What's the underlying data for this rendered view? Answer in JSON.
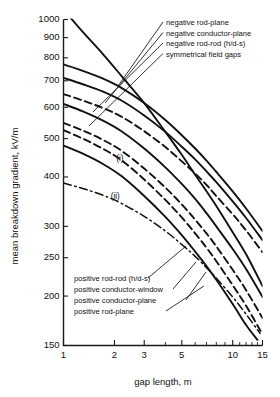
{
  "chart_data": {
    "type": "line",
    "title": "",
    "xlabel": "gap length, m",
    "ylabel": "mean breakdown gradient, kV/m",
    "xscale": "log",
    "yscale": "log",
    "xlim": [
      1,
      15
    ],
    "ylim": [
      150,
      1000
    ],
    "grid": false,
    "legend_position": "inline-annotations",
    "xticks": [
      1,
      2,
      3,
      5,
      10,
      15
    ],
    "xticklabels": [
      "1",
      "2",
      "3",
      "5",
      "10",
      "15"
    ],
    "xminor": [
      4,
      6,
      7,
      8,
      9,
      11,
      12,
      13,
      14
    ],
    "yticks": [
      150,
      200,
      250,
      300,
      400,
      500,
      600,
      700,
      800,
      900,
      1000
    ],
    "yticklabels": [
      "150",
      "200",
      "250",
      "300",
      "400",
      "500",
      "600",
      "700",
      "800",
      "900",
      "1000"
    ],
    "annotations": [
      {
        "name": "curve-note-i",
        "text": "(i)",
        "x": 2.05,
        "y": 440
      },
      {
        "name": "curve-note-ii",
        "text": "(ii)",
        "x": 1.9,
        "y": 352
      }
    ],
    "series": [
      {
        "name": "symmetrical field gaps",
        "style": "solid",
        "x": [
          1,
          1.3,
          1.7,
          2.2,
          3,
          4,
          5,
          6,
          7,
          8,
          10,
          12,
          15
        ],
        "y": [
          1060,
          930,
          820,
          720,
          615,
          520,
          455,
          405,
          368,
          338,
          290,
          255,
          212
        ]
      },
      {
        "name": "negative rod-plane",
        "style": "solid",
        "x": [
          1,
          1.3,
          1.7,
          2.2,
          3,
          4,
          5,
          6,
          7,
          8,
          10,
          12,
          15
        ],
        "y": [
          770,
          742,
          710,
          672,
          615,
          557,
          510,
          472,
          440,
          412,
          368,
          333,
          292
        ]
      },
      {
        "name": "negative conductor-plane",
        "style": "solid",
        "x": [
          1,
          1.3,
          1.7,
          2.2,
          3,
          4,
          5,
          6,
          7,
          8,
          10,
          12,
          15
        ],
        "y": [
          712,
          686,
          658,
          624,
          572,
          520,
          477,
          443,
          413,
          388,
          347,
          315,
          277
        ]
      },
      {
        "name": "negative rod-rod (h/d-s)",
        "style": "dashed",
        "x": [
          1,
          1.3,
          1.7,
          2.2,
          3,
          4,
          5,
          6,
          7,
          8,
          10,
          12,
          15
        ],
        "y": [
          648,
          624,
          598,
          568,
          522,
          476,
          438,
          408,
          382,
          358,
          322,
          293,
          258
        ]
      },
      {
        "name": "positive rod-rod (h/d-s)",
        "style": "solid",
        "x": [
          1,
          1.3,
          1.7,
          2.2,
          3,
          4,
          5,
          6,
          7,
          8,
          10,
          12,
          15
        ],
        "y": [
          612,
          586,
          556,
          522,
          472,
          423,
          384,
          352,
          324,
          300,
          263,
          234,
          199
        ]
      },
      {
        "name": "positive conductor-window",
        "style": "dashed",
        "x": [
          1,
          1.3,
          1.7,
          2.2,
          3,
          4,
          5,
          6,
          7,
          8,
          10,
          12,
          15
        ],
        "y": [
          548,
          524,
          497,
          466,
          420,
          376,
          341,
          312,
          288,
          267,
          233,
          207,
          176
        ]
      },
      {
        "name": "positive conductor-plane",
        "style": "dashed",
        "x": [
          1,
          1.3,
          1.7,
          2.2,
          3,
          4,
          5,
          6,
          7,
          8,
          10,
          12,
          15
        ],
        "y": [
          525,
          500,
          472,
          441,
          394,
          350,
          316,
          288,
          265,
          245,
          213,
          189,
          160
        ]
      },
      {
        "name": "positive rod-plane",
        "style": "solid",
        "x": [
          1,
          1.3,
          1.7,
          2.2,
          3,
          4,
          5,
          6,
          7,
          8,
          10,
          12,
          14
        ],
        "y": [
          480,
          458,
          432,
          402,
          358,
          317,
          285,
          259,
          238,
          220,
          191,
          169,
          155
        ]
      },
      {
        "name": "curve-ii-dashdot",
        "style": "dashdot",
        "x": [
          1,
          1.3,
          1.7,
          2.2,
          3,
          4,
          5,
          6,
          7,
          8,
          10,
          12,
          14.5
        ],
        "y": [
          386,
          374,
          360,
          343,
          318,
          292,
          270,
          252,
          236,
          222,
          199,
          180,
          161
        ]
      }
    ]
  },
  "legend_top": {
    "items": [
      {
        "label": "negative rod-plane"
      },
      {
        "label": "negative conductor-plane"
      },
      {
        "label": "negative rod-rod (h/d-s)"
      },
      {
        "label": "symmetrical field gaps"
      }
    ]
  },
  "legend_bottom": {
    "items": [
      {
        "label": "positive rod-rod (h/d-s)"
      },
      {
        "label": "positive conductor-window"
      },
      {
        "label": "positive conductor-plane"
      },
      {
        "label": "positive rod-plane"
      }
    ]
  }
}
